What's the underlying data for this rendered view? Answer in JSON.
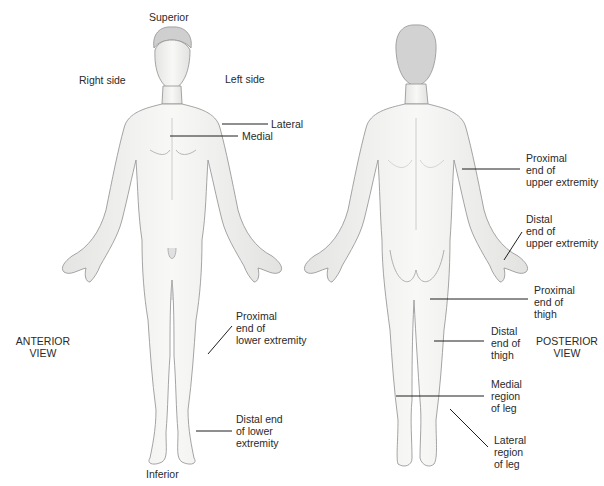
{
  "diagram": {
    "colors": {
      "skin": "#f6f5f3",
      "outline": "#9a9a9a",
      "shade": "#dcdcdc",
      "leader": "#1f1f1f",
      "text": "#2a2a2a"
    },
    "orientation": {
      "superior": "Superior",
      "inferior": "Inferior",
      "right_side": "Right side",
      "left_side": "Left side"
    },
    "views": {
      "anterior": {
        "line1": "ANTERIOR",
        "line2": "VIEW"
      },
      "posterior": {
        "line1": "POSTERIOR",
        "line2": "VIEW"
      }
    },
    "anterior_labels": {
      "lateral": "Lateral",
      "medial": "Medial",
      "proximal_lower": {
        "l1": "Proximal",
        "l2": "end of",
        "l3": "lower extremity"
      },
      "distal_lower": {
        "l1": "Distal end",
        "l2": "of lower",
        "l3": "extremity"
      }
    },
    "posterior_labels": {
      "proximal_upper": {
        "l1": "Proximal",
        "l2": "end of",
        "l3": "upper extremity"
      },
      "distal_upper": {
        "l1": "Distal",
        "l2": "end of",
        "l3": "upper extremity"
      },
      "proximal_thigh": {
        "l1": "Proximal",
        "l2": "end of",
        "l3": "thigh"
      },
      "distal_thigh": {
        "l1": "Distal",
        "l2": "end of",
        "l3": "thigh"
      },
      "medial_leg": {
        "l1": "Medial",
        "l2": "region",
        "l3": "of leg"
      },
      "lateral_leg": {
        "l1": "Lateral",
        "l2": "region",
        "l3": "of leg"
      }
    }
  }
}
